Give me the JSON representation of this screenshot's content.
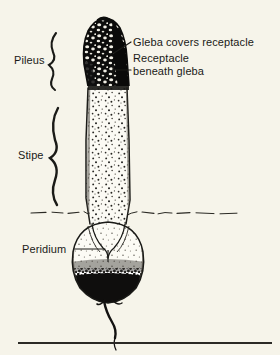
{
  "figure": {
    "kind": "botanical-line-illustration",
    "background_color": "#f6f4ea",
    "ink_color": "#1a1a17"
  },
  "labels": {
    "pileus": "Pileus",
    "stipe": "Stipe",
    "peridium": "Peridium",
    "gleba_covers_receptacle": "Gleba covers receptacle",
    "receptacle_line1": "Receptacle",
    "receptacle_line2": "beneath gleba"
  },
  "parts": [
    {
      "name": "pileus",
      "label": "Pileus",
      "shading": "solid black with white reticulate pits",
      "bracket": "left-hand wavy brace"
    },
    {
      "name": "stipe",
      "label": "Stipe",
      "shading": "light with fine stipple dots",
      "bracket": "left-hand wavy brace"
    },
    {
      "name": "peridium",
      "label": "Peridium",
      "shading": "egg-shaped volva, dark stippled lower half",
      "bracket": "horizontal leader line"
    },
    {
      "name": "gleba",
      "label": "Gleba covers receptacle",
      "shading": "dark spore mass on cap surface",
      "bracket": "diagonal leader line"
    },
    {
      "name": "receptacle",
      "label": "Receptacle beneath gleba",
      "shading": "pale band at cap margin",
      "bracket": "diagonal leader line"
    }
  ],
  "features": {
    "soil_line": "broken dashed horizontal ground line at stipe base",
    "rhizomorph": "thin wavy mycelial cord descending from volva base",
    "bottom_rule": "horizontal caption rule near lower edge"
  }
}
